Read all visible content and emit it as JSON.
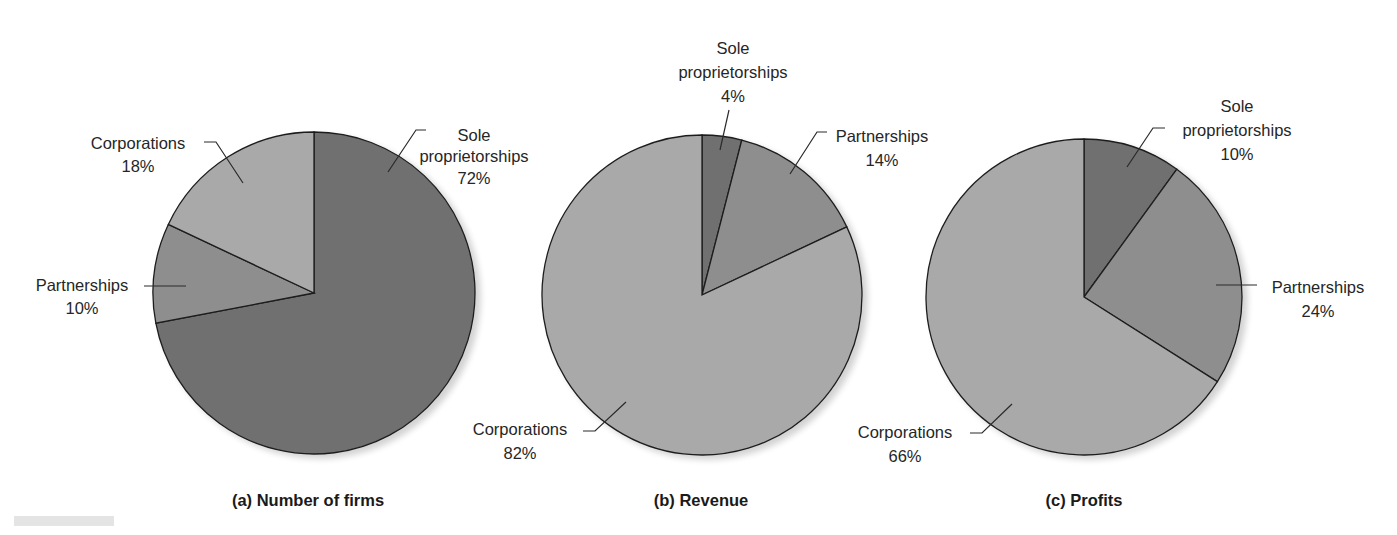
{
  "chart_data": [
    {
      "type": "pie",
      "title": "(a) Number of firms",
      "categories": [
        "Sole proprietorships",
        "Partnerships",
        "Corporations"
      ],
      "values": [
        72,
        10,
        18
      ],
      "unit": "%",
      "labels": [
        {
          "lines": [
            "Sole",
            "proprietorships",
            "72%"
          ]
        },
        {
          "lines": [
            "Partnerships",
            "10%"
          ]
        },
        {
          "lines": [
            "Corporations",
            "18%"
          ]
        }
      ],
      "center": [
        314,
        293
      ],
      "radius": 161
    },
    {
      "type": "pie",
      "title": "(b) Revenue",
      "categories": [
        "Sole proprietorships",
        "Partnerships",
        "Corporations"
      ],
      "values": [
        4,
        14,
        82
      ],
      "unit": "%",
      "labels": [
        {
          "lines": [
            "Sole",
            "proprietorships",
            "4%"
          ]
        },
        {
          "lines": [
            "Partnerships",
            "14%"
          ]
        },
        {
          "lines": [
            "Corporations",
            "82%"
          ]
        }
      ],
      "center": [
        702,
        295
      ],
      "radius": 160
    },
    {
      "type": "pie",
      "title": "(c) Profits",
      "categories": [
        "Sole proprietorships",
        "Partnerships",
        "Corporations"
      ],
      "values": [
        10,
        24,
        66
      ],
      "unit": "%",
      "labels": [
        {
          "lines": [
            "Sole",
            "proprietorships",
            "10%"
          ]
        },
        {
          "lines": [
            "Partnerships",
            "24%"
          ]
        },
        {
          "lines": [
            "Corporations",
            "66%"
          ]
        }
      ],
      "center": [
        1084,
        297
      ],
      "radius": 158
    }
  ],
  "colors": {
    "sole_proprietorships": "#6f6f6f",
    "partnerships": "#8e8e8e",
    "corporations": "#a9a9a9",
    "outline": "#1e1e1e"
  },
  "captions": {
    "a": "(a) Number of firms",
    "b": "(b) Revenue",
    "c": "(c) Profits"
  },
  "pie_a": {
    "sole": {
      "l1": "Sole",
      "l2": "proprietorships",
      "pct": "72%"
    },
    "partnerships": {
      "l1": "Partnerships",
      "pct": "10%"
    },
    "corporations": {
      "l1": "Corporations",
      "pct": "18%"
    }
  },
  "pie_b": {
    "sole": {
      "l1": "Sole",
      "l2": "proprietorships",
      "pct": "4%"
    },
    "partnerships": {
      "l1": "Partnerships",
      "pct": "14%"
    },
    "corporations": {
      "l1": "Corporations",
      "pct": "82%"
    }
  },
  "pie_c": {
    "sole": {
      "l1": "Sole",
      "l2": "proprietorships",
      "pct": "10%"
    },
    "partnerships": {
      "l1": "Partnerships",
      "pct": "24%"
    },
    "corporations": {
      "l1": "Corporations",
      "pct": "66%"
    }
  }
}
